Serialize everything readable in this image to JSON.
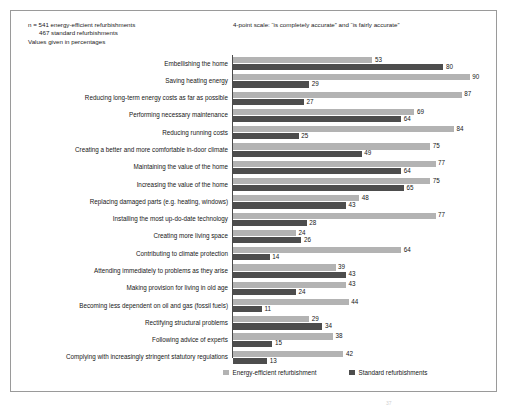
{
  "notes": {
    "line1": "n = 541 energy-efficient refurbishments",
    "line2": "467 standard refurbishments",
    "line3": "Values given in percentages",
    "scale": "4-point scale: “is completely accurate” and “is fairly accurate”"
  },
  "legend": {
    "series1_label": "Energy-efficient refurbishment",
    "series2_label": "Standard refurbishments",
    "series1_color": "#b3b3b3",
    "series2_color": "#4d4d4d"
  },
  "page_mark": "37",
  "chart_data": {
    "type": "bar",
    "orientation": "horizontal",
    "title": "",
    "subtitle": "",
    "xlabel": "",
    "ylabel": "",
    "xlim": [
      0,
      100
    ],
    "grid": false,
    "legend_position": "bottom",
    "value_unit": "percent",
    "annotations": [
      "n = 541 energy-efficient refurbishments",
      "467 standard refurbishments",
      "Values given in percentages",
      "4-point scale: “is completely accurate” and “is fairly accurate”"
    ],
    "categories": [
      "Embellishing the home",
      "Saving heating energy",
      "Reducing long-term energy costs as far as possible",
      "Performing necessary maintenance",
      "Reducing running costs",
      "Creating a better and more comfortable in-door climate",
      "Maintaining the value of the home",
      "Increasing the value of the home",
      "Replacing damaged parts (e.g. heating, windows)",
      "Installing the most up-do-date technology",
      "Creating more living space",
      "Contributing to climate protection",
      "Attending immediately to problems as they arise",
      "Making provision for living in old age",
      "Becoming less dependent on oil and gas (fossil fuels)",
      "Rectifying structural problems",
      "Following advice of experts",
      "Complying with increasingly stringent statutory regulations"
    ],
    "series": [
      {
        "name": "Energy-efficient refurbishment",
        "color": "#b3b3b3",
        "values": [
          53,
          90,
          87,
          69,
          84,
          75,
          77,
          75,
          48,
          77,
          24,
          64,
          39,
          43,
          44,
          29,
          38,
          42
        ]
      },
      {
        "name": "Standard refurbishments",
        "color": "#4d4d4d",
        "values": [
          80,
          29,
          27,
          64,
          25,
          49,
          64,
          65,
          43,
          28,
          26,
          14,
          43,
          24,
          11,
          34,
          15,
          13
        ]
      }
    ]
  }
}
